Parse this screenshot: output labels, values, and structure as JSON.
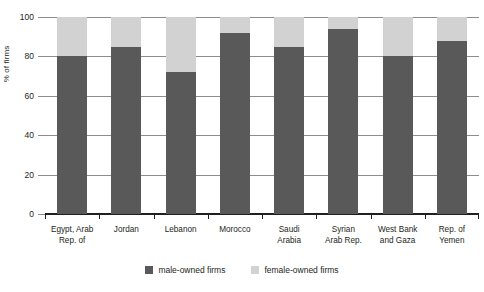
{
  "chart_data": {
    "type": "bar",
    "stacked": true,
    "title": "",
    "xlabel": "",
    "ylabel": "% of firms",
    "ylim": [
      0,
      100
    ],
    "yticks": [
      0,
      20,
      40,
      60,
      80,
      100
    ],
    "grid": true,
    "legend_position": "bottom",
    "categories": [
      "Egypt, Arab Rep. of",
      "Jordan",
      "Lebanon",
      "Morocco",
      "Saudi Arabia",
      "Syrian Arab Rep.",
      "West Bank and Gaza",
      "Rep. of Yemen"
    ],
    "category_lines": [
      [
        "Egypt, Arab",
        "Rep. of"
      ],
      [
        "Jordan",
        ""
      ],
      [
        "Lebanon",
        ""
      ],
      [
        "Morocco",
        ""
      ],
      [
        "Saudi",
        "Arabia"
      ],
      [
        "Syrian",
        "Arab Rep."
      ],
      [
        "West Bank",
        "and Gaza"
      ],
      [
        "Rep. of",
        "Yemen"
      ]
    ],
    "series": [
      {
        "name": "male-owned firms",
        "color": "#595959",
        "values": [
          80,
          85,
          72,
          92,
          85,
          94,
          80,
          88
        ]
      },
      {
        "name": "female-owned firms",
        "color": "#d2d2d2",
        "values": [
          20,
          15,
          28,
          8,
          15,
          6,
          20,
          12
        ]
      }
    ]
  },
  "axis": {
    "y_title": "% of firms",
    "y_tick_labels": [
      "100",
      "80",
      "60",
      "40",
      "20",
      "0"
    ]
  },
  "legend": {
    "items": [
      {
        "label": "male-owned firms",
        "color": "#595959"
      },
      {
        "label": "female-owned firms",
        "color": "#d2d2d2"
      }
    ]
  },
  "colors": {
    "male": "#595959",
    "female": "#d2d2d2",
    "gridline": "#8d8d8d",
    "axis": "#231f20",
    "text": "#231f20",
    "background": "#ffffff"
  }
}
